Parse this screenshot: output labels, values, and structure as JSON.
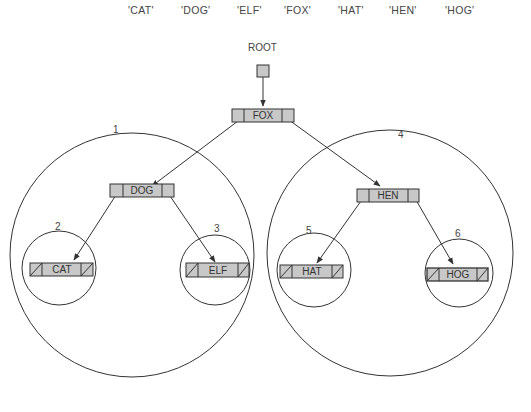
{
  "keys": [
    "'CAT'",
    "'DOG'",
    "'ELF'",
    "'FOX'",
    "'HAT'",
    "'HEN'",
    "'HOG'"
  ],
  "root_label": "ROOT",
  "nodes": {
    "fox": "FOX",
    "dog": "DOG",
    "hen": "HEN",
    "cat": "CAT",
    "elf": "ELF",
    "hat": "HAT",
    "hog": "HOG"
  },
  "regions": {
    "r1": "1",
    "r2": "2",
    "r3": "3",
    "r4": "4",
    "r5": "5",
    "r6": "6"
  },
  "colors": {
    "node_fill": "#c8c8c8",
    "stroke": "#333333"
  }
}
